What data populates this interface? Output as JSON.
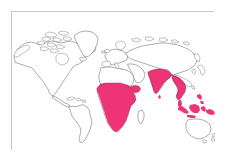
{
  "figure": {
    "type": "distribution-map",
    "projection": "equirectangular",
    "width_px": 227,
    "height_px": 167,
    "title": "",
    "caption": "",
    "background_color": "#ffffff"
  },
  "frame": {
    "border_color": "#c9c9c9",
    "fill_color": "#ffffff",
    "left_px": 11,
    "top_px": 11,
    "width_px": 203,
    "height_px": 139
  },
  "style": {
    "coastline_color": "#4a4a4a",
    "land_fill_color": "#ffffff",
    "highlight_color": "#ee3377",
    "ocean_color": "#ffffff"
  },
  "legend": {
    "visible": false,
    "entries": [
      {
        "label": "Distribution range",
        "color": "#ee3377",
        "swatch": "filled-region"
      },
      {
        "label": "Not present",
        "color": "#ffffff",
        "swatch": "outline-region"
      }
    ]
  },
  "chart_data": {
    "type": "map",
    "title": "",
    "xlabel": "",
    "ylabel": "",
    "highlight_color": "#ee3377",
    "base_color": "#ffffff",
    "outline_color": "#4a4a4a",
    "regions_highlighted": [
      "Sub-Saharan Africa",
      "Sahel",
      "West Africa",
      "Central Africa",
      "East Africa",
      "Southern Africa",
      "Indian subcontinent",
      "Sri Lanka",
      "Myanmar",
      "Thailand",
      "Indochina",
      "Malay Peninsula",
      "Indonesia",
      "Philippines (partial)",
      "New Guinea (partial)"
    ],
    "regions_not_highlighted": [
      "North America",
      "Greenland",
      "South America",
      "Europe",
      "Russia",
      "North Africa",
      "Sahara",
      "Madagascar",
      "China (northern)",
      "Japan",
      "Australia",
      "New Zealand"
    ]
  },
  "landmasses": [
    {
      "name": "north-america",
      "highlighted": false
    },
    {
      "name": "greenland",
      "highlighted": false
    },
    {
      "name": "south-america",
      "highlighted": false
    },
    {
      "name": "europe",
      "highlighted": false
    },
    {
      "name": "africa-north",
      "highlighted": false
    },
    {
      "name": "africa-sub-saharan",
      "highlighted": true
    },
    {
      "name": "madagascar",
      "highlighted": false
    },
    {
      "name": "asia-north",
      "highlighted": false
    },
    {
      "name": "india",
      "highlighted": true
    },
    {
      "name": "southeast-asia",
      "highlighted": true
    },
    {
      "name": "indonesia",
      "highlighted": true
    },
    {
      "name": "australia",
      "highlighted": false
    },
    {
      "name": "new-zealand",
      "highlighted": false
    },
    {
      "name": "japan",
      "highlighted": false
    }
  ]
}
